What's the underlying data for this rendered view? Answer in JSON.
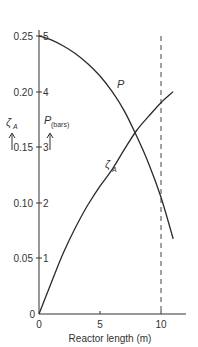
{
  "chart_data": {
    "type": "line",
    "title": "",
    "xlabel": "Reactor length (m)",
    "ylabel_left": "ζA",
    "ylabel_right": "P (bars)",
    "xlim": [
      0,
      12
    ],
    "ylim_left": [
      0,
      0.25
    ],
    "ylim_right": [
      0,
      5
    ],
    "x_ticks": [
      "0",
      "5",
      "10"
    ],
    "y_ticks_left": [
      "0",
      "0.05",
      "0.10",
      "0.15",
      "0.20",
      "0.25"
    ],
    "y_ticks_right": [
      "1",
      "2",
      "3",
      "4",
      "5"
    ],
    "grid": false,
    "vertical_reference_line": {
      "x": 10,
      "style": "dashed"
    },
    "series": [
      {
        "name": "P",
        "axis": "right",
        "x": [
          0,
          1,
          2,
          3,
          4,
          5,
          6,
          7,
          8,
          9,
          10,
          11
        ],
        "values": [
          5.0,
          4.93,
          4.82,
          4.68,
          4.5,
          4.28,
          4.0,
          3.65,
          3.2,
          2.7,
          2.1,
          1.35
        ]
      },
      {
        "name": "ζA",
        "axis": "left",
        "x": [
          0,
          1,
          2,
          3,
          4,
          5,
          6,
          7,
          8,
          9,
          10,
          11
        ],
        "values": [
          0.0,
          0.028,
          0.055,
          0.078,
          0.098,
          0.115,
          0.13,
          0.148,
          0.165,
          0.178,
          0.19,
          0.2
        ]
      }
    ],
    "annotations": [
      "P",
      "ζA"
    ]
  },
  "labels": {
    "xlabel": "Reactor length (m)",
    "y_left_symbol": "ζ",
    "y_left_sub": "A",
    "y_right_symbol": "P",
    "y_right_sub": "(bars)",
    "curve_P": "P",
    "curve_zeta": "ζ",
    "curve_zeta_sub": "A",
    "origin_left": "0",
    "x_ticks": [
      "0",
      "5",
      "10"
    ],
    "y_left": [
      "0.05",
      "0.10",
      "0.15",
      "0.20",
      "0.25"
    ],
    "y_right": [
      "1",
      "2",
      "3",
      "4",
      "5"
    ]
  }
}
